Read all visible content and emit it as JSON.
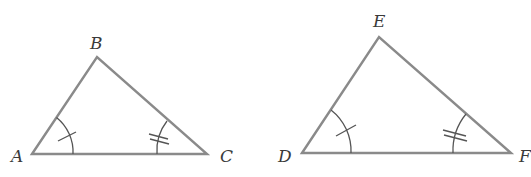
{
  "figure": {
    "colors": {
      "edge": "#8a8a8a",
      "marks": "#555555",
      "labels": "#3a3a3a"
    },
    "triangles": [
      {
        "name": "ABC",
        "vertices": {
          "A": "A",
          "B": "B",
          "C": "C"
        },
        "marks": {
          "A": "single tick arc",
          "C": "double tick arc"
        }
      },
      {
        "name": "DEF",
        "vertices": {
          "D": "D",
          "E": "E",
          "F": "F"
        },
        "marks": {
          "D": "single tick arc",
          "F": "double tick arc"
        }
      }
    ]
  }
}
